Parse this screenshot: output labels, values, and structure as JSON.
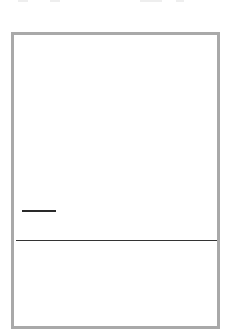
{
  "panel": {
    "border_color": "#a9a9a9",
    "upper_area": {
      "dash_mark": "—"
    },
    "divider_color": "#333333",
    "lower_area": {}
  }
}
